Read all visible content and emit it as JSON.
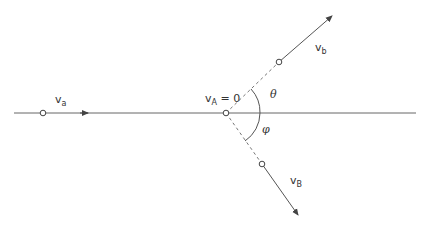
{
  "diagram": {
    "type": "collision-vector-diagram",
    "colors": {
      "line": "#555555",
      "text": "#333333",
      "background": "#ffffff"
    },
    "labels": {
      "incoming": {
        "main": "v",
        "sub": "a"
      },
      "target": {
        "main": "v",
        "sub": "A",
        "suffix": " = 0"
      },
      "outgoing_b": {
        "main": "v",
        "sub": "b"
      },
      "outgoing_B": {
        "main": "v",
        "sub": "B"
      },
      "angle_theta": "θ",
      "angle_phi": "φ"
    }
  }
}
